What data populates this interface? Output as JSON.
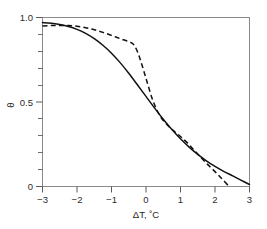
{
  "figure": {
    "background_color": "#ffffff",
    "frame_color": "#8a8a8a",
    "curve_color": "#111111"
  },
  "chart_data": {
    "type": "line",
    "title": "",
    "subtitle": "",
    "xlabel": "ΔT, ˚C",
    "ylabel": "θ",
    "xlim": [
      -3,
      3
    ],
    "ylim": [
      0,
      1
    ],
    "grid": false,
    "legend": null,
    "legend_position": "none",
    "x_ticks": [
      -3,
      -2,
      -1,
      0,
      1,
      2,
      3
    ],
    "x_tick_labels": [
      "−3",
      "−2",
      "−1",
      "0",
      "1",
      "2",
      "3"
    ],
    "y_ticks": [
      0,
      0.1,
      0.2,
      0.3,
      0.4,
      0.5,
      0.6,
      0.7,
      0.8,
      0.9,
      1.0
    ],
    "y_tick_labels_major": [
      "0",
      "0.5",
      "1.0"
    ],
    "y_major_ticks": [
      0,
      0.5,
      1.0
    ],
    "annotations": [],
    "series": [
      {
        "name": "solid-curve",
        "style": "solid",
        "color": "#111111",
        "x": [
          -3.0,
          -2.75,
          -2.5,
          -2.25,
          -2.0,
          -1.75,
          -1.5,
          -1.25,
          -1.0,
          -0.75,
          -0.5,
          -0.25,
          0.0,
          0.25,
          0.5,
          0.75,
          1.0,
          1.25,
          1.5,
          1.75,
          2.0,
          2.25,
          2.5,
          2.75,
          3.0
        ],
        "y": [
          0.97,
          0.966,
          0.958,
          0.947,
          0.93,
          0.906,
          0.875,
          0.836,
          0.789,
          0.733,
          0.67,
          0.602,
          0.533,
          0.464,
          0.398,
          0.337,
          0.282,
          0.233,
          0.19,
          0.152,
          0.119,
          0.09,
          0.064,
          0.038,
          0.012
        ]
      },
      {
        "name": "dashed-curve",
        "style": "dashed",
        "color": "#111111",
        "x": [
          -3.0,
          -2.75,
          -2.5,
          -2.25,
          -2.0,
          -1.75,
          -1.5,
          -1.25,
          -1.0,
          -0.75,
          -0.5,
          -0.35,
          -0.2,
          0.0,
          0.2,
          0.4,
          0.6,
          0.8,
          1.0,
          1.2,
          1.4,
          1.6,
          1.8,
          2.0,
          2.2,
          2.4
        ],
        "y": [
          0.95,
          0.952,
          0.953,
          0.952,
          0.948,
          0.94,
          0.928,
          0.912,
          0.894,
          0.875,
          0.857,
          0.838,
          0.772,
          0.64,
          0.508,
          0.42,
          0.368,
          0.33,
          0.296,
          0.258,
          0.214,
          0.17,
          0.128,
          0.088,
          0.046,
          0.002
        ]
      }
    ]
  }
}
